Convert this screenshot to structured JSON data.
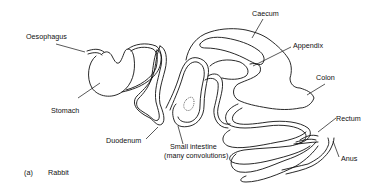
{
  "diagram": {
    "caption": {
      "letter": "(a)",
      "text": "Rabbit"
    },
    "labels": {
      "oesophagus": "Oesophagus",
      "stomach": "Stomach",
      "duodenum": "Duodenum",
      "small_intestine_1": "Small  intestine",
      "small_intestine_2": "(many  convolutions)",
      "caecum": "Caecum",
      "appendix": "Appendix",
      "colon": "Colon",
      "rectum": "Rectum",
      "anus": "Anus"
    },
    "colors": {
      "line": "#111111",
      "background": "#ffffff"
    }
  }
}
